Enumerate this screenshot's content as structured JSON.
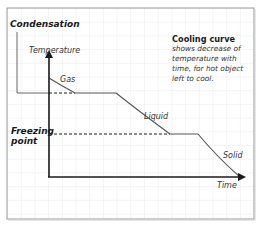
{
  "diagram": {
    "labels": {
      "condensation": "Condensation",
      "freezing_point_line1": "Freezing",
      "freezing_point_line2": "point",
      "y_axis": "Temperature",
      "x_axis": "Time",
      "gas": "Gas",
      "liquid": "Liquid",
      "solid": "Solid"
    },
    "note": {
      "title": "Cooling curve",
      "body": "shows decrease of temperature with time, for hot object left to cool."
    },
    "colors": {
      "grid": "#e3e3e3",
      "frame": "#9a9a9a",
      "curve": "#555555",
      "axis": "#1a1a1a"
    }
  }
}
